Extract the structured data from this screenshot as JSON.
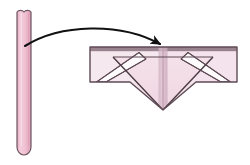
{
  "canvas": {
    "width": 250,
    "height": 165,
    "background": "#ffffff"
  },
  "palette": {
    "strip_fill_light": "#f0c9d6",
    "strip_fill_dark": "#e5a8bd",
    "panel_fill": "#f4e2ea",
    "panel_fill_pale": "#f7eaf1",
    "triangle_fill": "#f2dbe6",
    "crease_band": "#d9b9c8",
    "outline": "#6b5560",
    "outline_dark": "#4a3a43",
    "white_band": "#fdfbfc",
    "arrow": "#111111"
  },
  "figure": {
    "source_strip": {
      "name": "vertical-paper-strip",
      "x": 17,
      "y": 9,
      "width": 14,
      "height": 146,
      "bottom_radius": 7,
      "fill": "#eebdcd",
      "stroke": "#6b5560"
    },
    "motion_arrow": {
      "name": "fold-direction-arrow",
      "start_x": 25,
      "start_y": 46,
      "end_x": 163,
      "end_y": 48,
      "curvature": "arc-upward",
      "head_direction": "down-right",
      "color": "#111111"
    },
    "folded_result": {
      "name": "folded-chevron-assembly",
      "bounds": {
        "x": 90,
        "y": 47,
        "width": 147,
        "height": 63
      },
      "left_panel": {
        "name": "left-flap-panel",
        "fill": "#f4e2ea"
      },
      "right_panel": {
        "name": "right-flap-panel",
        "fill": "#f4e2ea"
      },
      "center_triangle": {
        "name": "center-fold-triangle",
        "apex_x": 163,
        "apex_y": 110,
        "fill": "#f2dbe6"
      },
      "left_white_band": {
        "name": "left-diagonal-crease-band",
        "fill": "#fdfbfc"
      },
      "right_white_band": {
        "name": "right-diagonal-crease-band",
        "fill": "#fdfbfc"
      },
      "center_crease": {
        "name": "vertical-center-crease-band",
        "x": 159,
        "width": 9,
        "fill": "#d9b9c8"
      },
      "top_shadow_edge": {
        "name": "top-edge-shadow",
        "fill": "#8b7580"
      }
    }
  },
  "labels": {
    "strip": "",
    "result": "",
    "arrow": ""
  }
}
